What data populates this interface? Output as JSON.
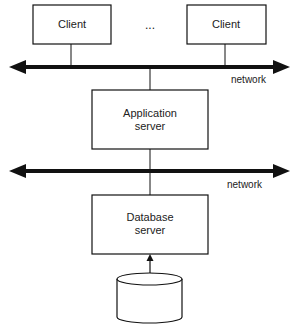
{
  "diagram": {
    "clients": [
      {
        "label": "Client"
      },
      {
        "label": "Client"
      }
    ],
    "ellipsis": "...",
    "networks": [
      {
        "label": "network"
      },
      {
        "label": "network"
      }
    ],
    "app_server": {
      "line1": "Application",
      "line2": "server"
    },
    "db_server": {
      "line1": "Database",
      "line2": "server"
    },
    "storage": {
      "shape": "cylinder"
    },
    "colors": {
      "stroke": "#111111",
      "background": "#ffffff"
    }
  }
}
